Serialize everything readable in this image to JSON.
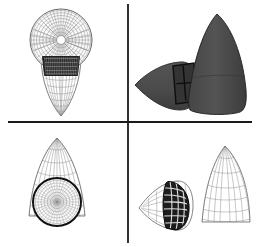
{
  "figure": {
    "width": 262,
    "height": 247,
    "background_color": "#ffffff",
    "layout": "2x2-panel-grid",
    "divider_color": "#1a1a1a",
    "vertical_divider_x": 128,
    "horizontal_divider_y": 122
  },
  "colors": {
    "wireframe_line": "#8a8a8a",
    "wireframe_line_dark": "#6e6e6e",
    "outline": "#5a5a5a",
    "band_dark": "#242424",
    "band_grid": "#c8c8c8",
    "solid_body_fill": "#4e4e4e",
    "solid_body_fill_light": "#5c5c5c",
    "solid_body_fill_dark": "#3a3a3a",
    "solid_outline": "#1f1f1f",
    "heavy_outline": "#111111",
    "background": "#ffffff"
  },
  "panels": [
    {
      "id": "top-left",
      "name": "wireframe-front-view",
      "view": "front",
      "render_mode": "wireframe",
      "objects": [
        {
          "name": "spherical-mesh-cap",
          "shape": "sphere",
          "mesh_type": "polar-radial",
          "radial_rings": 9,
          "angular_spokes": 36,
          "center_x": 61,
          "center_y": 40,
          "radius": 31
        },
        {
          "name": "dark-grid-band",
          "shape": "trapezoidal-band",
          "mesh_type": "fine-structured-grid",
          "fill": "#242424",
          "columns": 18,
          "rows": 4
        },
        {
          "name": "ogive-wireframe-body",
          "shape": "ogive-teardrop",
          "orientation": "apex-down",
          "mesh_type": "structured-quad",
          "longitudinal_lines": 13,
          "circumferential_lines": 11
        }
      ]
    },
    {
      "id": "top-right",
      "name": "solid-shaded-perspective-view",
      "view": "perspective",
      "render_mode": "solid-shaded",
      "objects": [
        {
          "name": "solid-cone-body",
          "shape": "ogive-cone",
          "orientation": "apex-up",
          "fill": "#4e4e4e"
        },
        {
          "name": "solid-horizontal-teardrop",
          "shape": "ogive-teardrop",
          "orientation": "apex-left",
          "fill": "#4e4e4e"
        },
        {
          "name": "dark-cylindrical-collar",
          "shape": "cylinder-band",
          "fill": "#2e2e2e",
          "edge_lines": 4
        }
      ]
    },
    {
      "id": "bottom-left",
      "name": "wireframe-cone-with-disc",
      "view": "front",
      "render_mode": "wireframe",
      "objects": [
        {
          "name": "ogive-wireframe-cone",
          "shape": "ogive-cone",
          "orientation": "apex-up",
          "mesh_type": "structured-quad",
          "longitudinal_lines": 11,
          "circumferential_lines": 9
        },
        {
          "name": "circular-polar-mesh-disc",
          "shape": "circle",
          "mesh_type": "polar-radial",
          "center_x": 57,
          "center_y": 202,
          "radius": 24,
          "outline": "#111111",
          "radial_rings": 7,
          "angular_spokes": 30
        }
      ]
    },
    {
      "id": "bottom-right",
      "name": "wireframe-perspective-view",
      "view": "perspective",
      "render_mode": "wireframe",
      "objects": [
        {
          "name": "ogive-wireframe-cone-rear",
          "shape": "ogive-cone",
          "orientation": "apex-up",
          "mesh_type": "structured-quad",
          "longitudinal_lines": 9,
          "circumferential_lines": 8
        },
        {
          "name": "horizontal-wireframe-teardrop",
          "shape": "ogive-teardrop",
          "orientation": "apex-left",
          "mesh_type": "structured-quad",
          "longitudinal_lines": 7,
          "circumferential_lines": 7
        },
        {
          "name": "dark-heavy-grid-band",
          "shape": "curved-band",
          "mesh_type": "coarse-structured-grid",
          "fill": "#1c1c1c",
          "columns": 5,
          "rows": 8
        }
      ]
    }
  ]
}
